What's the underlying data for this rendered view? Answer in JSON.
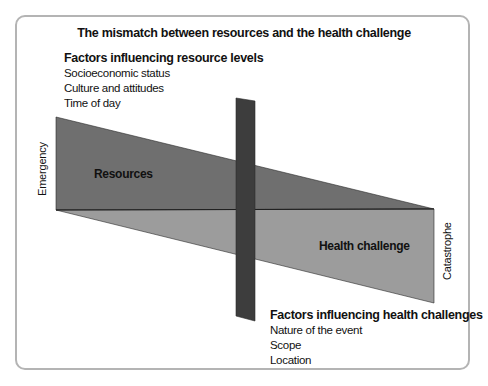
{
  "title": "The mismatch between resources and the health challenge",
  "resource_factors": {
    "heading": "Factors influencing resource levels",
    "items": [
      "Socioeconomic status",
      "Culture and attitudes",
      "Time of day"
    ]
  },
  "health_factors": {
    "heading": "Factors influencing health challenges",
    "items": [
      "Nature of the event",
      "Scope",
      "Location"
    ]
  },
  "shapes": {
    "resources_label": "Resources",
    "health_label": "Health challenge"
  },
  "axis": {
    "left_label": "Emergency",
    "right_label": "Catastrophe"
  },
  "colors": {
    "resources": "#6f6f6f",
    "health": "#9c9c9c",
    "bar": "#3d3d3d",
    "frame": "#b4b4b4"
  }
}
